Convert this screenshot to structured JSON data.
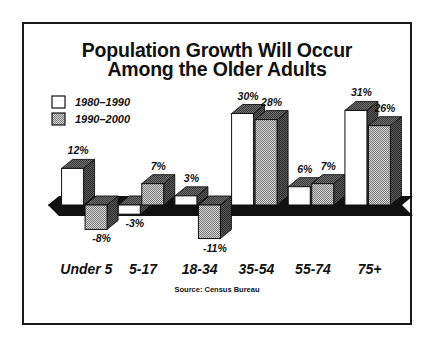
{
  "chart_data": {
    "type": "bar",
    "title": "Population Growth Will Occur Among the Older Adults",
    "title_line1": "Population Growth Will Occur",
    "title_line2": "Among the Older Adults",
    "xlabel": "",
    "ylabel": "",
    "ylim": [
      -11,
      31
    ],
    "grid": false,
    "legend_position": "top-left",
    "annotation": "Source: Census Bureau",
    "categories": [
      "Under 5",
      "5-17",
      "18-34",
      "35-54",
      "55-74",
      "75+"
    ],
    "series": [
      {
        "name": "1980–1990",
        "values": [
          12,
          -3,
          3,
          30,
          6,
          31
        ],
        "labels": [
          "12%",
          "-3%",
          "3%",
          "30%",
          "6%",
          "31%"
        ],
        "color": "#ffffff"
      },
      {
        "name": "1990–2000",
        "values": [
          -8,
          7,
          -11,
          28,
          7,
          26
        ],
        "labels": [
          "-8%",
          "7%",
          "-11%",
          "28%",
          "7%",
          "26%"
        ],
        "color": "#a9a9a9"
      }
    ]
  },
  "legend": {
    "items": [
      {
        "label": "1980–1990",
        "swatch": "#ffffff"
      },
      {
        "label": "1990–2000",
        "swatch": "#a9a9a9"
      }
    ]
  },
  "source": {
    "label": "Source: Census Bureau"
  },
  "colors": {
    "frame": "#1a1a1a",
    "bar_front_light": "#ffffff",
    "bar_front_gray": "#a9a9a9",
    "bar_top": "#555555",
    "bar_side": "#3c3c3c",
    "baseline": "#111111",
    "text": "#111111",
    "background": "#ffffff"
  }
}
